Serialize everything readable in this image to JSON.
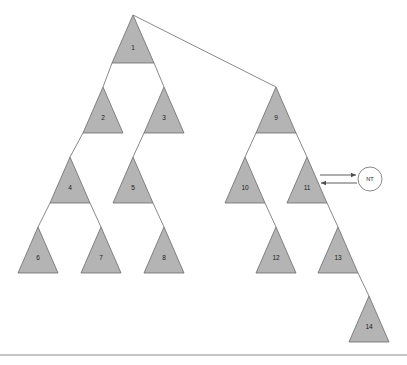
{
  "figure": {
    "type": "tree-diagram",
    "title": "",
    "background_color": "#ffffff",
    "triangle_fill": "#b4b4b4",
    "triangle_stroke": "#6b6b6b",
    "edge_color": "#6b6b6b",
    "arrow_color": "#4d4d4d"
  },
  "nodes": [
    {
      "id": "n1",
      "label": "1",
      "apex_x": 133,
      "apex_y": 15,
      "half_width": 21,
      "height": 48,
      "label_x": 133,
      "label_y": 48
    },
    {
      "id": "n2",
      "label": "2",
      "apex_x": 103,
      "apex_y": 87,
      "half_width": 20,
      "height": 46,
      "label_x": 103,
      "label_y": 118
    },
    {
      "id": "n3",
      "label": "3",
      "apex_x": 164,
      "apex_y": 87,
      "half_width": 20,
      "height": 46,
      "label_x": 164,
      "label_y": 118
    },
    {
      "id": "n4",
      "label": "4",
      "apex_x": 70,
      "apex_y": 157,
      "half_width": 20,
      "height": 46,
      "label_x": 70,
      "label_y": 188
    },
    {
      "id": "n5",
      "label": "5",
      "apex_x": 133,
      "apex_y": 157,
      "half_width": 20,
      "height": 46,
      "label_x": 133,
      "label_y": 188
    },
    {
      "id": "n6",
      "label": "6",
      "apex_x": 38,
      "apex_y": 227,
      "half_width": 20,
      "height": 46,
      "label_x": 38,
      "label_y": 258
    },
    {
      "id": "n7",
      "label": "7",
      "apex_x": 101,
      "apex_y": 227,
      "half_width": 20,
      "height": 46,
      "label_x": 101,
      "label_y": 258
    },
    {
      "id": "n8",
      "label": "8",
      "apex_x": 164,
      "apex_y": 227,
      "half_width": 20,
      "height": 46,
      "label_x": 164,
      "label_y": 258
    },
    {
      "id": "n9",
      "label": "9",
      "apex_x": 276,
      "apex_y": 87,
      "half_width": 20,
      "height": 46,
      "label_x": 276,
      "label_y": 118
    },
    {
      "id": "n10",
      "label": "10",
      "apex_x": 245,
      "apex_y": 157,
      "half_width": 20,
      "height": 46,
      "label_x": 245,
      "label_y": 188
    },
    {
      "id": "n11",
      "label": "11",
      "apex_x": 307,
      "apex_y": 157,
      "half_width": 20,
      "height": 46,
      "label_x": 307,
      "label_y": 188
    },
    {
      "id": "n12",
      "label": "12",
      "apex_x": 276,
      "apex_y": 227,
      "half_width": 20,
      "height": 46,
      "label_x": 276,
      "label_y": 258
    },
    {
      "id": "n13",
      "label": "13",
      "apex_x": 338,
      "apex_y": 227,
      "half_width": 20,
      "height": 46,
      "label_x": 338,
      "label_y": 258
    },
    {
      "id": "n14",
      "label": "14",
      "apex_x": 369,
      "apex_y": 296,
      "half_width": 20,
      "height": 46,
      "label_x": 369,
      "label_y": 327
    }
  ],
  "edges": [
    {
      "from": "n1",
      "to": "n2",
      "x1": 112,
      "y1": 63,
      "x2": 103,
      "y2": 87
    },
    {
      "from": "n1",
      "to": "n3",
      "x1": 154,
      "y1": 63,
      "x2": 164,
      "y2": 87
    },
    {
      "from": "n1",
      "to": "n9",
      "x1": 133,
      "y1": 15,
      "x2": 276,
      "y2": 87
    },
    {
      "from": "n2",
      "to": "n4",
      "x1": 83,
      "y1": 133,
      "x2": 70,
      "y2": 157
    },
    {
      "from": "n3",
      "to": "n5",
      "x1": 144,
      "y1": 133,
      "x2": 133,
      "y2": 157
    },
    {
      "from": "n4",
      "to": "n6",
      "x1": 50,
      "y1": 203,
      "x2": 38,
      "y2": 227
    },
    {
      "from": "n4",
      "to": "n7",
      "x1": 90,
      "y1": 203,
      "x2": 101,
      "y2": 227
    },
    {
      "from": "n5",
      "to": "n8",
      "x1": 153,
      "y1": 203,
      "x2": 164,
      "y2": 227
    },
    {
      "from": "n9",
      "to": "n10",
      "x1": 256,
      "y1": 133,
      "x2": 245,
      "y2": 157
    },
    {
      "from": "n9",
      "to": "n11",
      "x1": 296,
      "y1": 133,
      "x2": 307,
      "y2": 157
    },
    {
      "from": "n10",
      "to": "n12",
      "x1": 265,
      "y1": 203,
      "x2": 276,
      "y2": 227
    },
    {
      "from": "n11",
      "to": "n13",
      "x1": 327,
      "y1": 203,
      "x2": 338,
      "y2": 227
    },
    {
      "from": "n13",
      "to": "n14",
      "x1": 358,
      "y1": 273,
      "x2": 369,
      "y2": 296
    }
  ],
  "annotation": {
    "id": "nt-marker",
    "label": "NT",
    "circle_cx": 370,
    "circle_cy": 179,
    "circle_r": 12,
    "arrow_to_circle": {
      "x1": 320,
      "y1": 175,
      "x2": 356,
      "y2": 175
    },
    "arrow_to_node": {
      "x1": 357,
      "y1": 183,
      "x2": 321,
      "y2": 183
    },
    "target_node": "n11"
  },
  "footer": {
    "rule_y": 355,
    "rule_x1": 0,
    "rule_x2": 407
  }
}
